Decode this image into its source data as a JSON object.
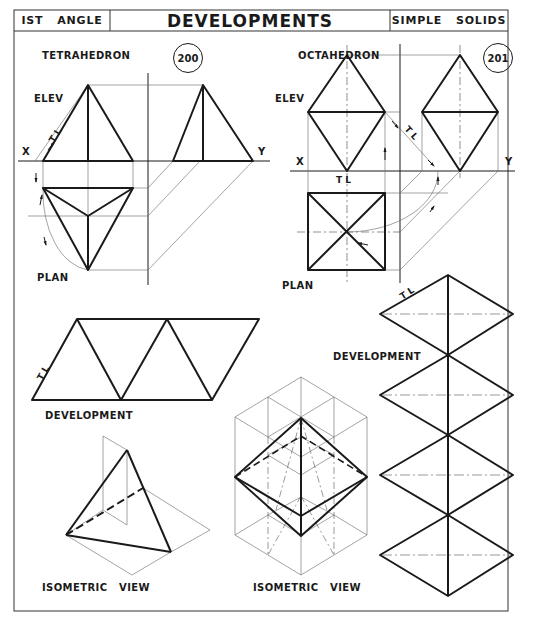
{
  "header": {
    "left_label": "IST   ANGLE",
    "title": "DEVELOPMENTS",
    "right_label": "SIMPLE   SOLIDS"
  },
  "colors": {
    "ink": "#1a1a1a",
    "paper": "#ffffff",
    "thin": "#555555"
  },
  "tetrahedron": {
    "title": "TETRAHEDRON",
    "plate_number": "200",
    "elev_label": "ELEV",
    "plan_label": "PLAN",
    "x_label": "X",
    "y_label": "Y",
    "tl_label": "T L",
    "development_label": "DEVELOPMENT",
    "isometric_label": "ISOMETRIC   VIEW"
  },
  "octahedron": {
    "title": "OCTAHEDRON",
    "plate_number": "201",
    "elev_label": "ELEV",
    "plan_label": "PLAN",
    "x_label": "X",
    "y_label": "Y",
    "tl_label_elev": "T L",
    "tl_label_base": "T L",
    "tl_label_dev": "T L",
    "development_label": "DEVELOPMENT",
    "isometric_label": "ISOMETRIC   VIEW"
  }
}
